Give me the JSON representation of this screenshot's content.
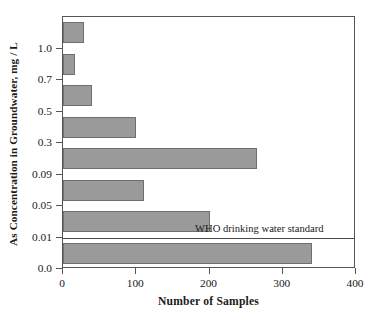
{
  "chart_data": {
    "type": "bar",
    "orientation": "horizontal",
    "title": "",
    "xlabel": "Number of Samples",
    "ylabel": "As Concentration in Groundwater, mg / L",
    "categories": [
      "> 1.0",
      "0.7 - 1.0",
      "0.5 - 0.7",
      "0.3 - 0.5",
      "0.09 - 0.3",
      "0.05 - 0.09",
      "0.01 - 0.05",
      "0.0 - 0.01"
    ],
    "values": [
      28,
      17,
      40,
      100,
      265,
      110,
      200,
      340
    ],
    "xlim": [
      0,
      400
    ],
    "xticks": [
      "0",
      "100",
      "200",
      "300",
      "400"
    ],
    "xtick_values": [
      0,
      100,
      200,
      300,
      400
    ],
    "yticks": [
      "1.0",
      "0.7",
      "0.5",
      "0.3",
      "0.09",
      "0.05",
      "0.01",
      "0.0"
    ],
    "ytick_values": [
      1.0,
      0.7,
      0.5,
      0.3,
      0.09,
      0.05,
      0.01,
      0.0
    ],
    "grid": false,
    "legend": false,
    "bar_color": "#9a9a9a",
    "bar_edge_color": "#6f6f6f",
    "axis_color": "#555555",
    "annotations": [
      {
        "text": "WHO drinking water standard",
        "at_y_value": 0.01,
        "line": "horizontal full-width"
      }
    ]
  }
}
